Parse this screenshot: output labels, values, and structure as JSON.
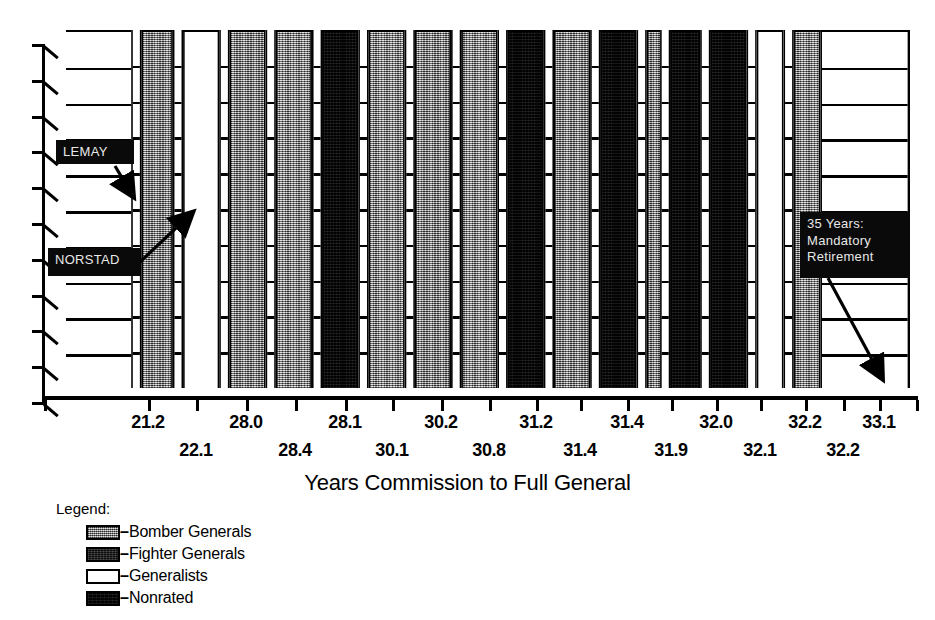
{
  "chart_data": {
    "type": "bar",
    "title": "",
    "xlabel": "Years Commission to Full General",
    "ylabel": "",
    "grid": true,
    "legend_position": "bottom-left",
    "orientation": "vertical-3d",
    "note": "Each bar is one general; bar value is years from commission to full general. Fill pattern encodes the general's background category.",
    "categories": [
      "21.2",
      "22.1",
      "28.0",
      "28.4",
      "28.1",
      "30.1",
      "30.2",
      "30.8",
      "31.2",
      "31.4",
      "31.4",
      "31.9",
      "32.0",
      "32.1",
      "32.2",
      "32.2",
      "33.1"
    ],
    "values": [
      21.2,
      22.1,
      28.0,
      28.4,
      28.1,
      30.1,
      30.2,
      30.8,
      31.2,
      31.4,
      31.4,
      31.9,
      32.0,
      32.1,
      32.2,
      32.2,
      33.1
    ],
    "series": [
      {
        "name": "Years Commission to Full General",
        "values": [
          21.2,
          22.1,
          28.0,
          28.4,
          28.1,
          30.1,
          30.2,
          30.8,
          31.2,
          31.4,
          31.4,
          31.9,
          32.0,
          32.1,
          32.2,
          32.2,
          33.1
        ]
      }
    ],
    "point_categories": [
      "generalist",
      "bomber",
      "generalist",
      "bomber",
      "bomber",
      "nonrated",
      "bomber",
      "bomber",
      "bomber",
      "nonrated",
      "bomber",
      "nonrated",
      "bomber",
      "nonrated",
      "nonrated",
      "generalist",
      "bomber"
    ],
    "xtick_labels_row1": [
      "21.2",
      "28.0",
      "28.1",
      "30.2",
      "31.2",
      "31.4",
      "32.0",
      "32.2",
      "33.1"
    ],
    "xtick_labels_row2": [
      "22.1",
      "28.4",
      "30.1",
      "30.8",
      "31.4",
      "31.9",
      "32.1",
      "32.2"
    ],
    "annotations": [
      {
        "id": "lemay",
        "text": "LEMAY",
        "points_to": "21.2 bar region"
      },
      {
        "id": "norstad",
        "text": "NORSTAD",
        "points_to": "22.1 bomber bar"
      },
      {
        "id": "retirement",
        "text": "35 Years:\nMandatory\nRetirement",
        "points_to": "right edge of axis"
      }
    ],
    "ylim": [
      0,
      10
    ],
    "y_gridline_count": 10
  },
  "axis": {
    "title": "Years Commission to Full General",
    "tick_row1": [
      {
        "label": "21.2",
        "x": 148
      },
      {
        "label": "28.0",
        "x": 246
      },
      {
        "label": "28.1",
        "x": 345
      },
      {
        "label": "30.2",
        "x": 441
      },
      {
        "label": "31.2",
        "x": 536
      },
      {
        "label": "31.4",
        "x": 627
      },
      {
        "label": "32.0",
        "x": 716
      },
      {
        "label": "32.2",
        "x": 805
      },
      {
        "label": "33.1",
        "x": 879
      }
    ],
    "tick_row2": [
      {
        "label": "22.1",
        "x": 196
      },
      {
        "label": "28.4",
        "x": 295
      },
      {
        "label": "30.1",
        "x": 392
      },
      {
        "label": "30.8",
        "x": 489
      },
      {
        "label": "31.4",
        "x": 580
      },
      {
        "label": "31.9",
        "x": 671
      },
      {
        "label": "32.1",
        "x": 760
      },
      {
        "label": "32.2",
        "x": 843
      }
    ]
  },
  "annotations": {
    "lemay": {
      "label": "LEMAY"
    },
    "norstad": {
      "label": "NORSTAD"
    },
    "retirement": {
      "label": "35 Years:\nMandatory\nRetirement"
    }
  },
  "legend": {
    "title": "Legend:",
    "items": [
      {
        "label": "Bomber Generals",
        "fill": "bomber",
        "color": "#8d8d8d"
      },
      {
        "label": "Fighter Generals",
        "fill": "fighter",
        "color": "#2a2a2a"
      },
      {
        "label": "Generalists",
        "fill": "generalist",
        "color": "#ffffff"
      },
      {
        "label": "Nonrated",
        "fill": "nonrated",
        "color": "#121212"
      }
    ],
    "dash": "–"
  },
  "bars": [
    {
      "i": 0,
      "fill": "generalist",
      "left": 0,
      "width": 96,
      "value": 21.2
    },
    {
      "i": 1,
      "fill": "bomber",
      "left": 96,
      "width": 40,
      "value": 22.1
    },
    {
      "i": 2,
      "fill": "generalist",
      "left": 149,
      "width": 46,
      "value": 28.0
    },
    {
      "i": 3,
      "fill": "bomber",
      "left": 208,
      "width": 46,
      "value": 28.4
    },
    {
      "i": 4,
      "fill": "bomber",
      "left": 267,
      "width": 46,
      "value": 28.1
    },
    {
      "i": 5,
      "fill": "nonrated",
      "left": 326,
      "width": 46,
      "value": 30.1
    },
    {
      "i": 6,
      "fill": "bomber",
      "left": 385,
      "width": 46,
      "value": 30.2
    },
    {
      "i": 7,
      "fill": "bomber",
      "left": 444,
      "width": 46,
      "value": 30.8
    },
    {
      "i": 8,
      "fill": "bomber",
      "left": 503,
      "width": 46,
      "value": 31.2
    },
    {
      "i": 9,
      "fill": "nonrated",
      "left": 562,
      "width": 46,
      "value": 31.4
    },
    {
      "i": 10,
      "fill": "bomber",
      "left": 621,
      "width": 46,
      "value": 31.4
    },
    {
      "i": 11,
      "fill": "nonrated",
      "left": 680,
      "width": 46,
      "value": 31.9
    },
    {
      "i": 12,
      "fill": "bomber",
      "left": 739,
      "width": 30,
      "value": 32.0
    },
    {
      "i": 13,
      "fill": "nonrated",
      "left": 769,
      "width": 38,
      "value": 32.1
    },
    {
      "i": 14,
      "fill": "nonrated",
      "left": 820,
      "width": 46,
      "value": 32.2
    }
  ]
}
